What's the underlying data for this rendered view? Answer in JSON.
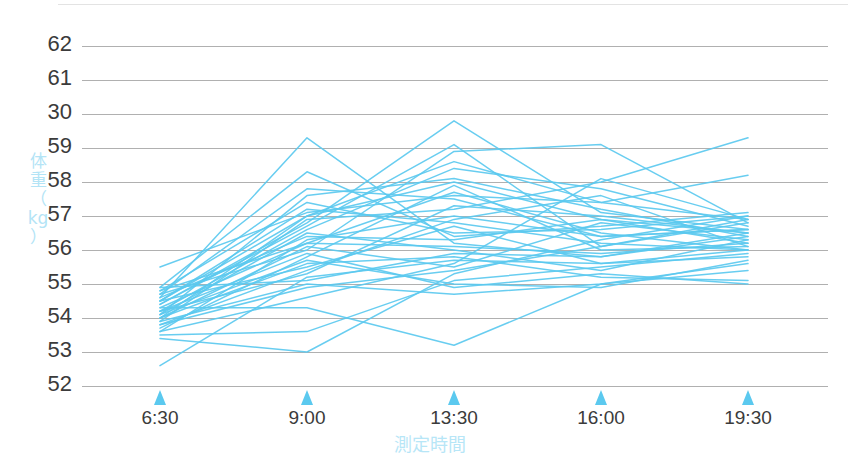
{
  "chart_data": {
    "type": "line",
    "title": "",
    "subtitle": "",
    "xlabel": "測定時間",
    "ylabel": "体重（kg）",
    "ylabel_chars": [
      "体",
      "重",
      "（",
      "kg",
      "）"
    ],
    "grid": true,
    "legend": "none",
    "line_color": "#5bc9ef",
    "grid_color": "#808080",
    "tick_marker_color": "#5bc9ef",
    "tick_label_color": "#3b3b3b",
    "axis_title_color": "#b3e4f6",
    "x": [
      "6:30",
      "9:00",
      "13:30",
      "16:00",
      "19:30"
    ],
    "xtick_labels": [
      "6:30",
      "9:00",
      "13:30",
      "16:00",
      "19:30"
    ],
    "ytick_labels": [
      "62",
      "61",
      "30",
      "59",
      "58",
      "57",
      "56",
      "55",
      "54",
      "53",
      "52"
    ],
    "ylim": [
      52,
      62
    ],
    "ylim_note": "y tick labels as printed, top to bottom: 62, 61, 30, 59, 58, 57, 56, 55, 54, 53, 52",
    "series": [
      {
        "name": "s1",
        "values": [
          53.6,
          56.3,
          57.0,
          56.4,
          56.6
        ]
      },
      {
        "name": "s2",
        "values": [
          54.0,
          57.0,
          58.6,
          57.4,
          56.9
        ]
      },
      {
        "name": "s3",
        "values": [
          54.3,
          56.2,
          56.1,
          55.9,
          56.2
        ]
      },
      {
        "name": "s4",
        "values": [
          52.6,
          55.2,
          55.7,
          55.6,
          56.0
        ]
      },
      {
        "name": "s5",
        "values": [
          54.6,
          59.3,
          56.2,
          55.8,
          56.4
        ]
      },
      {
        "name": "s6",
        "values": [
          54.2,
          55.3,
          57.3,
          57.0,
          56.5
        ]
      },
      {
        "name": "s7",
        "values": [
          55.5,
          57.1,
          57.6,
          57.4,
          58.2
        ]
      },
      {
        "name": "s8",
        "values": [
          53.9,
          55.0,
          54.7,
          55.0,
          55.4
        ]
      },
      {
        "name": "s9",
        "values": [
          54.1,
          56.5,
          56.0,
          55.4,
          56.3
        ]
      },
      {
        "name": "s10",
        "values": [
          54.4,
          56.8,
          59.8,
          57.1,
          56.6
        ]
      },
      {
        "name": "s11",
        "values": [
          53.8,
          54.9,
          55.4,
          56.1,
          56.9
        ]
      },
      {
        "name": "s12",
        "values": [
          54.5,
          57.2,
          56.8,
          56.2,
          56.0
        ]
      },
      {
        "name": "s13",
        "values": [
          53.5,
          53.6,
          55.1,
          55.5,
          55.9
        ]
      },
      {
        "name": "s14",
        "values": [
          54.7,
          56.0,
          58.9,
          59.1,
          56.8
        ]
      },
      {
        "name": "s15",
        "values": [
          54.0,
          55.6,
          55.8,
          55.2,
          55.1
        ]
      },
      {
        "name": "s16",
        "values": [
          54.8,
          57.4,
          56.5,
          56.6,
          57.0
        ]
      },
      {
        "name": "s17",
        "values": [
          53.7,
          55.8,
          57.9,
          56.0,
          56.1
        ]
      },
      {
        "name": "s18",
        "values": [
          54.2,
          56.6,
          58.4,
          57.8,
          56.7
        ]
      },
      {
        "name": "s19",
        "values": [
          54.9,
          55.1,
          55.9,
          55.8,
          56.5
        ]
      },
      {
        "name": "s20",
        "values": [
          53.9,
          56.9,
          57.2,
          58.0,
          59.3
        ]
      },
      {
        "name": "s21",
        "values": [
          54.3,
          54.3,
          53.2,
          55.0,
          55.6
        ]
      },
      {
        "name": "s22",
        "values": [
          54.6,
          56.4,
          56.3,
          56.9,
          56.2
        ]
      },
      {
        "name": "s23",
        "values": [
          53.4,
          53.0,
          55.3,
          56.3,
          57.0
        ]
      },
      {
        "name": "s24",
        "values": [
          54.1,
          57.6,
          58.1,
          57.2,
          56.4
        ]
      },
      {
        "name": "s25",
        "values": [
          54.5,
          55.5,
          56.7,
          55.6,
          55.8
        ]
      },
      {
        "name": "s26",
        "values": [
          54.0,
          56.1,
          55.5,
          56.8,
          56.3
        ]
      },
      {
        "name": "s27",
        "values": [
          54.7,
          57.8,
          57.5,
          56.4,
          56.6
        ]
      },
      {
        "name": "s28",
        "values": [
          53.8,
          55.4,
          56.9,
          57.6,
          56.1
        ]
      },
      {
        "name": "s29",
        "values": [
          54.4,
          56.7,
          59.1,
          56.1,
          56.8
        ]
      },
      {
        "name": "s30",
        "values": [
          54.2,
          55.9,
          54.9,
          55.3,
          55.0
        ]
      },
      {
        "name": "s31",
        "values": [
          54.9,
          58.3,
          56.4,
          56.7,
          57.1
        ]
      },
      {
        "name": "s32",
        "values": [
          53.6,
          54.6,
          55.6,
          58.1,
          56.9
        ]
      },
      {
        "name": "s33",
        "values": [
          54.8,
          56.2,
          57.7,
          56.5,
          56.0
        ]
      },
      {
        "name": "s34",
        "values": [
          54.1,
          55.7,
          55.0,
          54.9,
          55.7
        ]
      },
      {
        "name": "s35",
        "values": [
          54.5,
          57.0,
          58.0,
          56.9,
          56.5
        ]
      }
    ]
  },
  "axes": {
    "plot_left_px": 82,
    "plot_right_px": 828,
    "grid_top_px": 46,
    "grid_bottom_px": 386,
    "data_left_px": 160,
    "data_right_px": 748
  }
}
